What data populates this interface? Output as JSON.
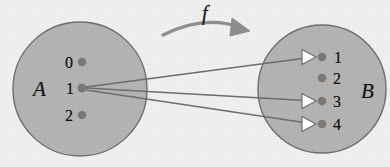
{
  "figure": {
    "type": "function-mapping-diagram",
    "background_color": "#f1f0ee",
    "set_fill_color": "#b4b3b1",
    "set_stroke_color": "#6f6e6c",
    "line_color": "#6d6c6a",
    "dot_color": "#7a7977",
    "arrowhead_fill": "#ffffff",
    "arrowhead_stroke": "#6d6c6a",
    "map_arrow_color": "#8e8d8b"
  },
  "domain_set": {
    "name": "A",
    "cx": 80,
    "cy": 89,
    "r": 67,
    "elements": [
      {
        "label": "0",
        "cx": 82,
        "cy": 62
      },
      {
        "label": "1",
        "cx": 82,
        "cy": 88
      },
      {
        "label": "2",
        "cx": 82,
        "cy": 115
      }
    ]
  },
  "codomain_set": {
    "name": "B",
    "cx": 322,
    "cy": 89,
    "r": 64,
    "elements": [
      {
        "label": "1",
        "cx": 322,
        "cy": 57
      },
      {
        "label": "2",
        "cx": 322,
        "cy": 78
      },
      {
        "label": "3",
        "cx": 322,
        "cy": 101
      },
      {
        "label": "4",
        "cx": 322,
        "cy": 124
      }
    ]
  },
  "mapping": {
    "label": "f",
    "label_x": 205,
    "label_y": 4,
    "arc_path": "M 163 35 Q 205 14 242 28",
    "arrow_tip_x": 247,
    "arrow_tip_y": 31,
    "edges": [
      {
        "from": "1",
        "to": "1",
        "x1": 86,
        "y1": 87,
        "x2": 316,
        "y2": 57
      },
      {
        "from": "1",
        "to": "3",
        "x1": 86,
        "y1": 88,
        "x2": 316,
        "y2": 101
      },
      {
        "from": "1",
        "to": "4",
        "x1": 86,
        "y1": 90,
        "x2": 316,
        "y2": 124
      }
    ]
  }
}
